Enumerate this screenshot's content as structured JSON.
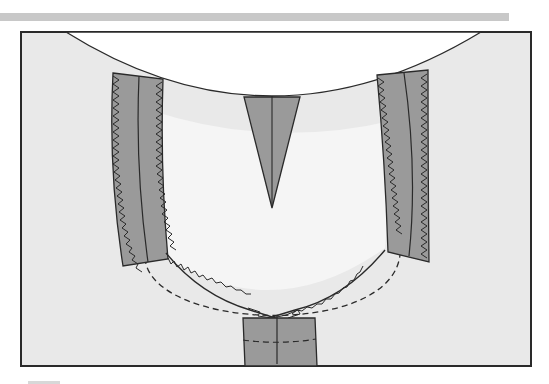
{
  "diagram": {
    "title": "",
    "colors": {
      "background": "#e9e9e9",
      "opening": "#ffffff",
      "fabric_piece": "#9a9a9a",
      "outline": "#2a2a2a",
      "header_bar": "#c8c8c8"
    },
    "elements": [
      {
        "id": "neckline-curve",
        "type": "curve"
      },
      {
        "id": "left-facing-strip",
        "type": "zigzag-edged strip"
      },
      {
        "id": "right-facing-strip",
        "type": "zigzag-edged strip"
      },
      {
        "id": "center-dart",
        "type": "dart"
      },
      {
        "id": "neck-opening-seam",
        "type": "zigzag curve"
      },
      {
        "id": "stitch-guide",
        "type": "dashed curve"
      },
      {
        "id": "center-placket",
        "type": "rectangle"
      }
    ]
  }
}
